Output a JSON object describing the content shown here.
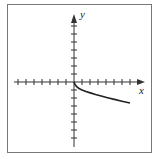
{
  "figure": {
    "type": "function-graph",
    "x_axis_label": "x",
    "y_axis_label": "y",
    "curve": "decreasing square-root-like curve starting at origin, heading right and down",
    "x_ticks_left": 7,
    "x_ticks_right": 8,
    "y_ticks_up": 7,
    "y_ticks_down": 7,
    "colors": {
      "frame": "#777777",
      "axes": "#333333",
      "curve": "#222222"
    }
  }
}
